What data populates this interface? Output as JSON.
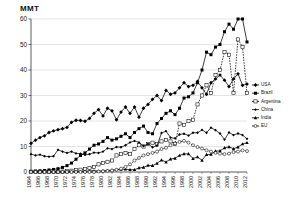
{
  "chart_data": {
    "type": "line",
    "title": "",
    "ylabel": "MMT",
    "xlabel": "",
    "ylim": [
      0,
      60
    ],
    "yticks": [
      0,
      10,
      20,
      30,
      40,
      50,
      60
    ],
    "grid": true,
    "legend_position": "right",
    "x": [
      1964,
      1965,
      1966,
      1967,
      1968,
      1969,
      1970,
      1971,
      1972,
      1973,
      1974,
      1975,
      1976,
      1977,
      1978,
      1979,
      1980,
      1981,
      1982,
      1983,
      1984,
      1985,
      1986,
      1987,
      1988,
      1989,
      1990,
      1991,
      1992,
      1993,
      1994,
      1995,
      1996,
      1997,
      1998,
      1999,
      2000,
      2001,
      2002,
      2003,
      2004,
      2005,
      2006,
      2007,
      2008,
      2009,
      2010,
      2011,
      2012
    ],
    "xtick_labels": [
      "1964",
      "1966",
      "1968",
      "1970",
      "1972",
      "1974",
      "1976",
      "1978",
      "1980",
      "1982",
      "1984",
      "1986",
      "1988",
      "1990",
      "1992",
      "1994",
      "1996",
      "1998",
      "2000",
      "2002",
      "2004",
      "2006",
      "2008",
      "2010",
      "2012"
    ],
    "series": [
      {
        "name": "USA",
        "marker": "filled-diamond",
        "values": [
          11.2,
          12.5,
          13.5,
          14.2,
          15.5,
          16.1,
          16.6,
          17.0,
          17.5,
          19.5,
          20.3,
          20.2,
          19.9,
          21.0,
          23.0,
          24.5,
          22.0,
          25.0,
          24.0,
          20.5,
          23.5,
          25.5,
          23.0,
          25.5,
          21.5,
          25.0,
          26.5,
          28.5,
          30.0,
          28.0,
          32.0,
          30.5,
          31.0,
          33.0,
          35.0,
          33.5,
          34.0,
          35.5,
          33.0,
          30.5,
          35.0,
          36.5,
          38.0,
          36.0,
          33.5,
          36.5,
          38.5,
          34.0,
          34.5
        ]
      },
      {
        "name": "Brazil",
        "marker": "filled-square",
        "values": [
          0.3,
          0.4,
          0.5,
          0.6,
          0.8,
          1.0,
          1.3,
          1.8,
          2.5,
          3.5,
          5.0,
          6.5,
          7.5,
          9.0,
          10.5,
          11.0,
          12.0,
          13.5,
          12.5,
          13.0,
          14.0,
          15.0,
          13.5,
          15.5,
          17.0,
          18.0,
          15.5,
          15.0,
          19.0,
          21.0,
          23.0,
          24.0,
          22.5,
          25.0,
          29.0,
          29.5,
          31.0,
          35.0,
          40.0,
          47.0,
          46.0,
          49.0,
          50.0,
          55.0,
          58.0,
          56.0,
          67.0,
          73.0,
          51.0
        ]
      },
      {
        "name": "Argentina",
        "marker": "open-square",
        "values": [
          0.02,
          0.03,
          0.04,
          0.05,
          0.06,
          0.07,
          0.1,
          0.15,
          0.3,
          0.5,
          0.7,
          0.9,
          1.2,
          1.6,
          2.0,
          3.0,
          3.5,
          4.0,
          4.5,
          6.5,
          7.0,
          7.5,
          7.0,
          9.0,
          10.5,
          10.0,
          11.0,
          11.5,
          11.0,
          12.0,
          12.5,
          12.0,
          11.0,
          19.0,
          18.5,
          20.0,
          20.5,
          26.5,
          30.0,
          34.0,
          31.0,
          38.0,
          40.0,
          47.0,
          46.0,
          31.0,
          52.0,
          49.0,
          31.0
        ]
      },
      {
        "name": "China",
        "marker": "filled-diamond-small",
        "values": [
          7.0,
          6.5,
          6.8,
          6.2,
          6.0,
          6.2,
          8.7,
          8.0,
          7.5,
          8.0,
          7.3,
          7.2,
          6.7,
          7.0,
          7.6,
          7.5,
          8.0,
          9.3,
          9.0,
          9.8,
          9.7,
          10.5,
          11.6,
          12.2,
          11.6,
          10.2,
          11.0,
          9.7,
          10.3,
          15.3,
          16.0,
          13.5,
          13.2,
          14.7,
          15.0,
          14.3,
          15.4,
          15.4,
          16.5,
          15.4,
          17.4,
          16.4,
          15.1,
          12.7,
          15.5,
          14.5,
          15.1,
          14.5,
          13.0
        ]
      },
      {
        "name": "India",
        "marker": "filled-triangle",
        "values": [
          0.01,
          0.01,
          0.02,
          0.02,
          0.03,
          0.04,
          0.05,
          0.06,
          0.08,
          0.1,
          0.12,
          0.2,
          0.3,
          0.4,
          0.5,
          0.4,
          0.44,
          0.6,
          0.7,
          0.9,
          1.0,
          1.1,
          0.9,
          0.9,
          1.6,
          1.8,
          2.6,
          2.5,
          3.4,
          4.7,
          3.9,
          5.1,
          5.4,
          6.5,
          7.1,
          7.1,
          5.3,
          5.9,
          4.6,
          6.8,
          6.9,
          8.2,
          8.3,
          9.5,
          9.9,
          9.1,
          9.8,
          11.0,
          11.5
        ]
      },
      {
        "name": "EU",
        "marker": "open-circle",
        "values": [
          0.0,
          0.0,
          0.0,
          0.0,
          0.0,
          0.0,
          0.0,
          0.0,
          0.0,
          0.0,
          0.0,
          0.0,
          0.0,
          0.0,
          0.0,
          0.2,
          0.3,
          0.4,
          0.6,
          0.9,
          1.3,
          2.0,
          3.0,
          4.5,
          5.5,
          6.5,
          7.0,
          7.5,
          8.0,
          9.0,
          9.5,
          10.5,
          11.2,
          11.8,
          12.2,
          11.5,
          10.5,
          9.8,
          9.2,
          8.5,
          8.0,
          7.5,
          7.2,
          7.0,
          7.2,
          7.8,
          8.0,
          8.5,
          8.2
        ]
      }
    ]
  },
  "legend": {
    "items": [
      {
        "label": "USA"
      },
      {
        "label": "Brazil"
      },
      {
        "label": "Argentina"
      },
      {
        "label": "China"
      },
      {
        "label": "India"
      },
      {
        "label": "EU"
      }
    ]
  }
}
